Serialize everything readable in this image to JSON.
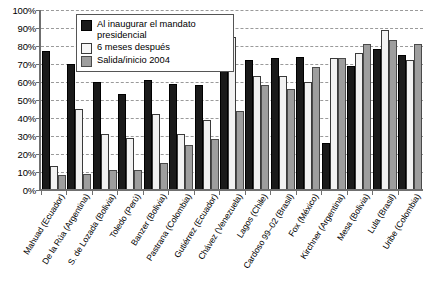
{
  "chart_data": {
    "type": "bar",
    "title": "",
    "xlabel": "",
    "ylabel": "",
    "ylim": [
      0,
      100
    ],
    "grid": true,
    "legend_position": "top-left-inside",
    "y_ticks": [
      "0%",
      "10%",
      "20%",
      "30%",
      "40%",
      "50%",
      "60%",
      "70%",
      "80%",
      "90%",
      "100%"
    ],
    "y_tick_values": [
      0,
      10,
      20,
      30,
      40,
      50,
      60,
      70,
      80,
      90,
      100
    ],
    "categories": [
      "Mahuad (Ecuador)",
      "De la Rúa (Argentina)",
      "S. de Lozada (Bolivia)",
      "Toledo (Perú)",
      "Banzer (Bolivia)",
      "Pastrana (Colombia)",
      "Gutiérrez (Ecuador)",
      "Chávez (Venezuela)",
      "Lagos (Chile)",
      "Cardoso 99–02 (Brasil)",
      "Fox (México)",
      "Kirchner (Argentina)",
      "Mesa (Bolivia)",
      "Lula (Brasil)",
      "Uribe (Colombia)"
    ],
    "series": [
      {
        "name": "Al inaugurar el mandato presidencial",
        "color": "#1a1a1a",
        "values": [
          76,
          69,
          59,
          52,
          60,
          58,
          57,
          92,
          71,
          72,
          73,
          25,
          68,
          77,
          74
        ]
      },
      {
        "name": "6 meses después",
        "color": "#f2f2f2",
        "values": [
          12,
          44,
          30,
          28,
          41,
          30,
          38,
          84,
          62,
          62,
          59,
          72,
          75,
          88,
          71
        ]
      },
      {
        "name": "Salida/inicio 2004",
        "color": "#9e9e9e",
        "values": [
          7,
          8,
          10,
          10,
          14,
          24,
          27,
          43,
          57,
          55,
          67,
          72,
          80,
          82,
          80
        ]
      }
    ]
  },
  "legend": {
    "items": [
      {
        "label": "Al inaugurar el mandato presidencial",
        "swatch": "black-square"
      },
      {
        "label": "6 meses después",
        "swatch": "white-square"
      },
      {
        "label": "Salida/inicio 2004",
        "swatch": "gray-square"
      }
    ]
  }
}
